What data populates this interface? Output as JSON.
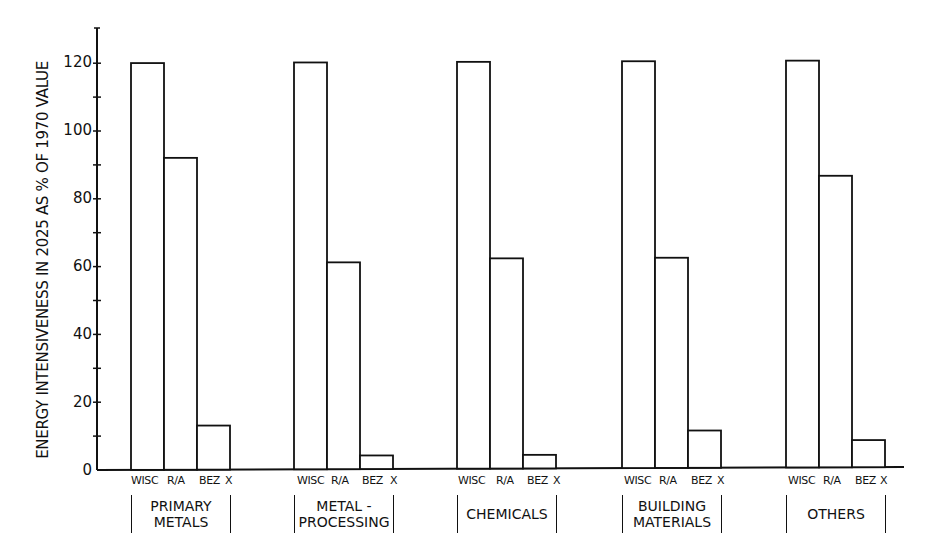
{
  "chart_data": {
    "type": "bar",
    "title": "",
    "xlabel": "",
    "ylabel": "ENERGY INTENSIVENESS IN 2025 AS % OF 1970 VALUE",
    "ylim": [
      0,
      130
    ],
    "yticks": [
      0,
      20,
      40,
      60,
      80,
      100,
      120
    ],
    "grid": false,
    "legend": null,
    "categories": [
      "PRIMARY METALS",
      "METAL-PROCESSING",
      "CHEMICALS",
      "BUILDING MATERIALS",
      "OTHERS"
    ],
    "category_display": [
      "PRIMARY\nMETALS",
      "METAL -\nPROCESSING",
      "CHEMICALS",
      "BUILDING\nMATERIALS",
      "OTHERS"
    ],
    "bar_labels": [
      "WISC",
      "R/A",
      "BEZ X"
    ],
    "series": [
      {
        "name": "WISC",
        "values": [
          120,
          120,
          120,
          120,
          120
        ]
      },
      {
        "name": "R/A",
        "values": [
          92,
          61,
          62,
          62,
          86
        ]
      },
      {
        "name": "BEZ X",
        "values": [
          13,
          4,
          4,
          11,
          8
        ]
      }
    ]
  },
  "axis": {
    "ylabel": "ENERGY INTENSIVENESS IN 2025 AS % OF 1970 VALUE",
    "tick_labels": [
      "0",
      "20",
      "40",
      "60",
      "80",
      "100",
      "120"
    ]
  },
  "groups": [
    {
      "label": "PRIMARY\nMETALS",
      "bars": [
        "WISC",
        "R/A",
        "BEZ",
        "X"
      ]
    },
    {
      "label": "METAL -\nPROCESSING",
      "bars": [
        "WISC",
        "R/A",
        "BEZ",
        "X"
      ]
    },
    {
      "label": "CHEMICALS",
      "bars": [
        "WISC",
        "R/A",
        "BEZ",
        "X"
      ]
    },
    {
      "label": "BUILDING\nMATERIALS",
      "bars": [
        "WISC",
        "R/A",
        "BEZ",
        "X"
      ]
    },
    {
      "label": "OTHERS",
      "bars": [
        "WISC",
        "R/A",
        "BEZ",
        "X"
      ]
    }
  ],
  "colors": {
    "ink": "#111111",
    "background": "#ffffff",
    "bar_fill": "#ffffff"
  }
}
